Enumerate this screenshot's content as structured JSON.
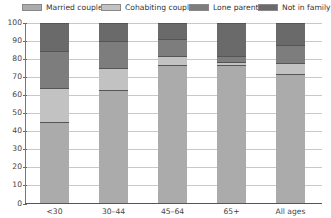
{
  "chart_data": {
    "type": "bar",
    "stacked": true,
    "title": "",
    "xlabel": "",
    "ylabel": "",
    "ylim": [
      0,
      100
    ],
    "yticks": [
      "0",
      "10",
      "20",
      "30",
      "40",
      "50",
      "60",
      "70",
      "80",
      "90",
      "100"
    ],
    "categories": [
      "<30",
      "30–44",
      "45–64",
      "65+",
      "All ages"
    ],
    "series": [
      {
        "name": "Married couple",
        "color": "#ababab",
        "values": [
          45,
          63,
          77,
          77,
          72
        ]
      },
      {
        "name": "Cohabiting couple",
        "color": "#c2c2c2",
        "values": [
          19,
          12,
          5,
          1.5,
          6
        ]
      },
      {
        "name": "Lone parent",
        "color": "#7d7d7d",
        "values": [
          20.5,
          15,
          9,
          3.5,
          10
        ]
      },
      {
        "name": "Not in family",
        "color": "#6a6a6a",
        "values": [
          15.5,
          10,
          9,
          18,
          12
        ]
      }
    ],
    "grid": true,
    "legend_position": "top"
  },
  "legend": {
    "items": [
      {
        "label": "Married couple",
        "color": "#ababab"
      },
      {
        "label": "Cohabiting couple",
        "color": "#c2c2c2"
      },
      {
        "label": "Lone parent",
        "color": "#7d7d7d"
      },
      {
        "label": "Not in family",
        "color": "#6a6a6a"
      }
    ]
  }
}
